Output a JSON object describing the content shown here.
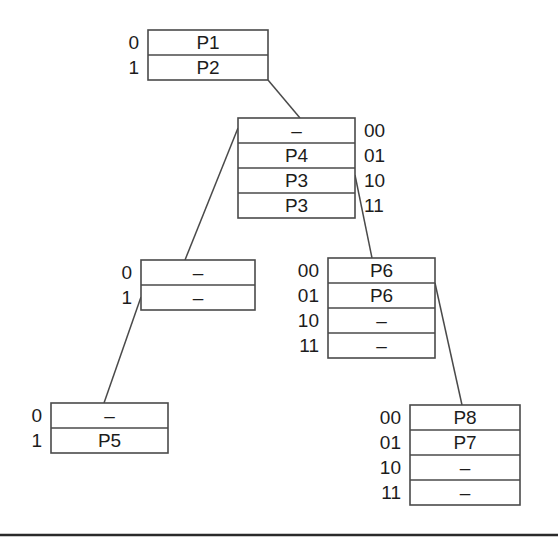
{
  "diagram": {
    "colors": {
      "background": "#ffffff",
      "stroke": "#4a4a4a",
      "text": "#1c1c1c",
      "rule": "#2a2a2a"
    },
    "dash_symbol": "–",
    "nodes": [
      {
        "id": "node-root",
        "name": "root-table",
        "x": 148,
        "y": 30,
        "width": 120,
        "row_height": 25,
        "index_side": "left",
        "rows": [
          {
            "index": "0",
            "value": "P1"
          },
          {
            "index": "1",
            "value": "P2"
          }
        ]
      },
      {
        "id": "node-level2",
        "name": "level2-table",
        "x": 238,
        "y": 118,
        "width": 117,
        "row_height": 25,
        "index_side": "right",
        "rows": [
          {
            "index": "00",
            "value": "–"
          },
          {
            "index": "01",
            "value": "P4"
          },
          {
            "index": "10",
            "value": "P3"
          },
          {
            "index": "11",
            "value": "P3"
          }
        ]
      },
      {
        "id": "node-left-mid",
        "name": "left-mid-table",
        "x": 141,
        "y": 260,
        "width": 114,
        "row_height": 25,
        "index_side": "left",
        "rows": [
          {
            "index": "0",
            "value": "–"
          },
          {
            "index": "1",
            "value": "–"
          }
        ]
      },
      {
        "id": "node-right-mid",
        "name": "right-mid-table",
        "x": 328,
        "y": 258,
        "width": 107,
        "row_height": 25,
        "index_side": "left",
        "rows": [
          {
            "index": "00",
            "value": "P6"
          },
          {
            "index": "01",
            "value": "P6"
          },
          {
            "index": "10",
            "value": "–"
          },
          {
            "index": "11",
            "value": "–"
          }
        ]
      },
      {
        "id": "node-left-leaf",
        "name": "left-leaf-table",
        "x": 51,
        "y": 403,
        "width": 117,
        "row_height": 25,
        "index_side": "left",
        "rows": [
          {
            "index": "0",
            "value": "–"
          },
          {
            "index": "1",
            "value": "P5"
          }
        ]
      },
      {
        "id": "node-right-leaf",
        "name": "right-leaf-table",
        "x": 410,
        "y": 405,
        "width": 110,
        "row_height": 25,
        "index_side": "left",
        "rows": [
          {
            "index": "00",
            "value": "P8"
          },
          {
            "index": "01",
            "value": "P7"
          },
          {
            "index": "10",
            "value": "–"
          },
          {
            "index": "11",
            "value": "–"
          }
        ]
      }
    ],
    "edges": [
      {
        "name": "edge-root-to-level2",
        "from": "node-root",
        "x1": 268,
        "y1": 80,
        "x2": 300,
        "y2": 118
      },
      {
        "name": "edge-level2-to-left-mid",
        "from": "node-level2",
        "x1": 238,
        "y1": 128,
        "x2": 185,
        "y2": 260
      },
      {
        "name": "edge-level2-to-right-mid",
        "from": "node-level2",
        "x1": 355,
        "y1": 175,
        "x2": 372,
        "y2": 258
      },
      {
        "name": "edge-left-mid-to-left-leaf",
        "from": "node-left-mid",
        "x1": 141,
        "y1": 297,
        "x2": 104,
        "y2": 403
      },
      {
        "name": "edge-right-mid-to-right-leaf",
        "from": "node-right-mid",
        "x1": 435,
        "y1": 283,
        "x2": 462,
        "y2": 405
      }
    ],
    "bottom_rule": {
      "name": "bottom-divider",
      "x1": 0,
      "y1": 535,
      "x2": 558,
      "y2": 535
    }
  }
}
